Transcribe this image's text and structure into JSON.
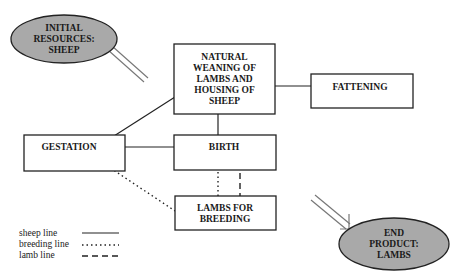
{
  "diagram": {
    "nodes": {
      "initial": {
        "lines": [
          "INITIAL",
          "RESOURCES:",
          "SHEEP"
        ],
        "shape": "ellipse"
      },
      "natural": {
        "lines": [
          "NATURAL",
          "WEANING OF",
          "LAMBS AND",
          "HOUSING OF",
          "SHEEP"
        ],
        "shape": "box"
      },
      "fattening": {
        "lines": [
          "FATTENING"
        ],
        "shape": "box"
      },
      "gestation": {
        "lines": [
          "GESTATION"
        ],
        "shape": "box"
      },
      "birth": {
        "lines": [
          "BIRTH"
        ],
        "shape": "box"
      },
      "lambs": {
        "lines": [
          "LAMBS FOR",
          "BREEDING"
        ],
        "shape": "box"
      },
      "end": {
        "lines": [
          "END",
          "PRODUCT:",
          "LAMBS"
        ],
        "shape": "ellipse"
      }
    },
    "edges": [
      {
        "from": "initial",
        "to": "natural",
        "type": "input-arrow"
      },
      {
        "from": "gestation",
        "to": "natural",
        "type": "sheep line"
      },
      {
        "from": "natural",
        "to": "fattening",
        "type": "sheep line"
      },
      {
        "from": "natural",
        "to": "birth",
        "type": "sheep line"
      },
      {
        "from": "gestation",
        "to": "birth",
        "type": "sheep line"
      },
      {
        "from": "gestation",
        "to": "lambs",
        "type": "breeding line"
      },
      {
        "from": "birth",
        "to": "lambs",
        "type": "breeding line"
      },
      {
        "from": "birth",
        "to": "lambs",
        "type": "lamb line"
      },
      {
        "from": "lambs",
        "to": "end",
        "type": "output-arrow"
      }
    ],
    "legend": [
      {
        "label": "sheep line",
        "style": "solid"
      },
      {
        "label": "breeding line",
        "style": "dotted"
      },
      {
        "label": "lamb line",
        "style": "dashed"
      }
    ],
    "colors": {
      "ellipse_fill": "#a9a9a9",
      "stroke": "#222222",
      "background": "#ffffff"
    }
  }
}
